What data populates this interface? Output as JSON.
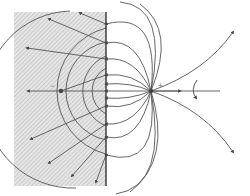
{
  "diagram": {
    "title": "",
    "type": "method-of-images field lines",
    "colors": {
      "line": "#555555",
      "plane": "#333333",
      "hatch_bg": "#e6e6e6",
      "hatch_line": "#b0b0b0",
      "charge": "#444444"
    },
    "conductor": {
      "x": 106,
      "y_top": 12,
      "y_bottom": 186
    },
    "shaded_region": {
      "x": 14,
      "y": 12,
      "width": 92,
      "height": 174
    },
    "real_charge": {
      "x": 151,
      "y": 91,
      "sign_label": "+"
    },
    "image_charge": {
      "x": 61,
      "y": 91,
      "sign_label": "−"
    },
    "labels": {
      "image_sign": "−",
      "real_sign": "+"
    }
  }
}
